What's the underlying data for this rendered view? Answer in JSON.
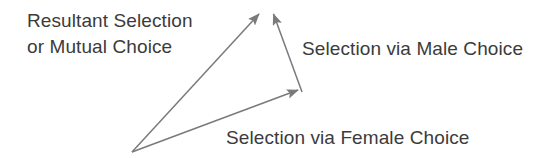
{
  "diagram": {
    "background_color": "#ffffff",
    "line_color": "#7a7a7a",
    "text_color": "#3b3b3b",
    "labels": {
      "resultant_line1": "Resultant Selection",
      "resultant_line2": "or Mutual Choice",
      "male": "Selection via Male Choice",
      "female": "Selection via Female Choice"
    },
    "vectors": [
      {
        "name": "resultant-selection-vector",
        "label": "Resultant Selection or Mutual Choice",
        "from": [
          132,
          152
        ],
        "to": [
          262,
          10
        ],
        "arrowheads": "end"
      },
      {
        "name": "female-choice-vector",
        "label": "Selection via Female Choice",
        "from": [
          132,
          152
        ],
        "to": [
          302,
          92
        ],
        "arrowheads": "end"
      },
      {
        "name": "male-choice-vector",
        "label": "Selection via Male Choice",
        "from": [
          302,
          92
        ],
        "to": [
          272,
          10
        ],
        "arrowheads": "end"
      }
    ],
    "origin_point": [
      132,
      152
    ]
  }
}
